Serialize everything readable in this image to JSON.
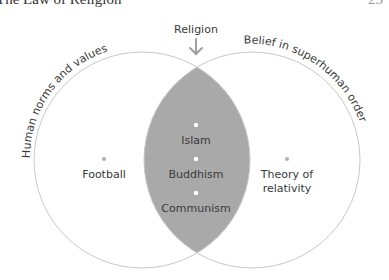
{
  "header": {
    "title": "The Law of Religion",
    "page_number": "25"
  },
  "diagram": {
    "type": "venn",
    "top_label": "Religion",
    "sets": [
      {
        "name": "Human norms and values"
      },
      {
        "name": "Belief in superhuman order"
      }
    ],
    "intersection_items": [
      "Islam",
      "Buddhism",
      "Communism"
    ],
    "left_only_items": [
      "Football"
    ],
    "right_only_items": [
      "Theory of",
      "relativity"
    ],
    "colors": {
      "circle_stroke": "#c8c8c8",
      "intersection_fill": "#a9a9a9",
      "dot_outer": "#aaaaaa",
      "dot_inner": "#ffffff",
      "arrow": "#a0a0a0",
      "text": "#3a3a3a"
    }
  }
}
